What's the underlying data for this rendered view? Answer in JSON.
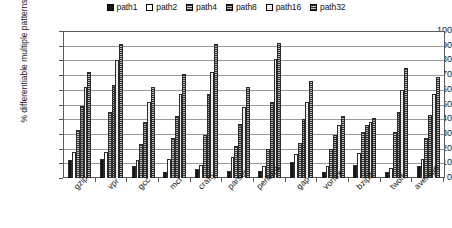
{
  "chart_data": {
    "type": "bar",
    "title": "",
    "xlabel": "",
    "ylabel": "% differentiable multiple patterns",
    "ylim": [
      0,
      100
    ],
    "yticks": [
      0,
      10,
      20,
      30,
      40,
      50,
      60,
      70,
      80,
      90,
      100
    ],
    "grid": true,
    "legend_position": "top-center",
    "categories": [
      "gzip",
      "vpr",
      "gcc",
      "mcf",
      "crafty",
      "parser",
      "perlbmk",
      "gap",
      "vortex",
      "bzip2",
      "twolf",
      "average"
    ],
    "series": [
      {
        "name": "path1",
        "fill": "solid-black",
        "values": [
          12,
          13,
          8,
          4,
          6,
          5,
          5,
          11,
          4,
          9,
          4,
          8
        ]
      },
      {
        "name": "path2",
        "fill": "white",
        "values": [
          18,
          18,
          12,
          13,
          9,
          14,
          8,
          16,
          8,
          17,
          7,
          13
        ]
      },
      {
        "name": "path4",
        "fill": "dark-dotted",
        "values": [
          33,
          45,
          23,
          27,
          29,
          22,
          20,
          24,
          20,
          31,
          31,
          27
        ]
      },
      {
        "name": "path8",
        "fill": "dark-dotted",
        "values": [
          49,
          63,
          38,
          42,
          57,
          37,
          52,
          40,
          29,
          36,
          45,
          43
        ]
      },
      {
        "name": "path16",
        "fill": "light-dotted",
        "values": [
          62,
          80,
          52,
          57,
          72,
          48,
          81,
          52,
          36,
          38,
          60,
          57
        ]
      },
      {
        "name": "path32",
        "fill": "dark-dotted",
        "values": [
          72,
          91,
          62,
          71,
          91,
          62,
          92,
          66,
          42,
          41,
          75,
          69
        ]
      }
    ]
  },
  "legend": {
    "items": [
      {
        "label": "path1"
      },
      {
        "label": "path2"
      },
      {
        "label": "path4"
      },
      {
        "label": "path8"
      },
      {
        "label": "path16"
      },
      {
        "label": "path32"
      }
    ]
  }
}
